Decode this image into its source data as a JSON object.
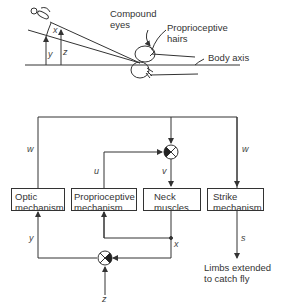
{
  "top_figure": {
    "labels": {
      "compound_eyes": [
        "Compound",
        "eyes"
      ],
      "proprioceptive_hairs": [
        "Proprioceptive",
        "hairs"
      ],
      "body_axis": "Body axis"
    },
    "angles": {
      "x": "x",
      "y": "y",
      "z": "z"
    }
  },
  "block_diagram": {
    "boxes": [
      {
        "id": "optic",
        "lines": [
          "Optic",
          "mechanism"
        ]
      },
      {
        "id": "proprioceptive",
        "lines": [
          "Proprioceptive",
          "mechanism"
        ]
      },
      {
        "id": "neck",
        "lines": [
          "Neck",
          "muscles"
        ]
      },
      {
        "id": "strike",
        "lines": [
          "Strike",
          "mechanism"
        ]
      }
    ],
    "signals": {
      "w_left": "w",
      "w_right": "w",
      "u": "u",
      "v": "v",
      "y": "y",
      "x": "x",
      "z": "z",
      "s": "s"
    },
    "output_label": [
      "Limbs extended",
      "to catch fly"
    ]
  }
}
